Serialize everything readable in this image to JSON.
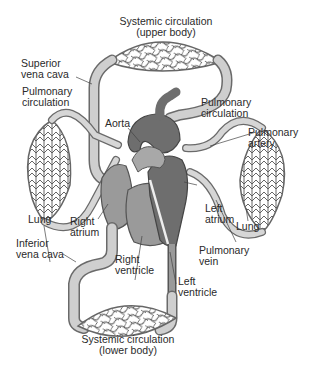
{
  "diagram": {
    "type": "anatomical-diagram",
    "colors": {
      "vessel_light": "#c8c8c8",
      "vessel_outline": "#6a6a6a",
      "heart_dark": "#6e6e6e",
      "heart_mid": "#9a9a9a",
      "capillary_fill": "#d0d0d0",
      "background": "#ffffff",
      "text": "#2a2a2a"
    },
    "labels": {
      "systemic_upper_line1": "Systemic circulation",
      "systemic_upper_line2": "(upper body)",
      "superior_vena_cava_line1": "Superior",
      "superior_vena_cava_line2": "vena cava",
      "pulmonary_circ_left_line1": "Pulmonary",
      "pulmonary_circ_left_line2": "circulation",
      "aorta": "Aorta",
      "pulmonary_circ_right_line1": "Pulmonary",
      "pulmonary_circ_right_line2": "circulation",
      "pulmonary_artery_line1": "Pulmonary",
      "pulmonary_artery_line2": "artery",
      "lung_left": "Lung",
      "right_atrium_line1": "Right",
      "right_atrium_line2": "atrium",
      "left_atrium_line1": "Left",
      "left_atrium_line2": "atrium",
      "lung_right": "Lung",
      "inferior_vena_cava_line1": "Inferior",
      "inferior_vena_cava_line2": "vena cava",
      "right_ventricle_line1": "Right",
      "right_ventricle_line2": "ventricle",
      "pulmonary_vein_line1": "Pulmonary",
      "pulmonary_vein_line2": "vein",
      "left_ventricle_line1": "Left",
      "left_ventricle_line2": "ventricle",
      "systemic_lower_line1": "Systemic circulation",
      "systemic_lower_line2": "(lower body)"
    }
  }
}
